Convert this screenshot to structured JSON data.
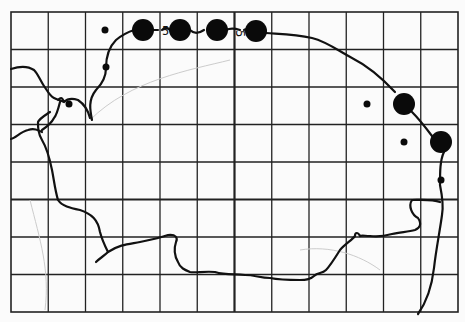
{
  "map": {
    "type": "distribution-grid-map",
    "grid": {
      "left": 11,
      "top": 12,
      "right": 458,
      "bottom": 312,
      "cols": 12,
      "rows": 8,
      "major_col": 6,
      "major_row": 5
    },
    "colors": {
      "background": "#fbfbfb",
      "grid": "#222222",
      "coast": "#111111",
      "dot": "#0a0a0a"
    },
    "labels": [
      {
        "text": "5",
        "x": 162,
        "y": 35
      },
      {
        "text": "5",
        "x": 236,
        "y": 30,
        "rotated": true
      }
    ],
    "records": [
      {
        "size": "large",
        "x": 143,
        "y": 30,
        "r": 11
      },
      {
        "size": "large",
        "x": 180,
        "y": 30,
        "r": 11
      },
      {
        "size": "large",
        "x": 217,
        "y": 30,
        "r": 11
      },
      {
        "size": "large",
        "x": 256,
        "y": 31,
        "r": 11
      },
      {
        "size": "large",
        "x": 404,
        "y": 104,
        "r": 11
      },
      {
        "size": "large",
        "x": 441,
        "y": 142,
        "r": 11
      },
      {
        "size": "small",
        "x": 105,
        "y": 30,
        "r": 3.5
      },
      {
        "size": "small",
        "x": 106,
        "y": 67,
        "r": 3.5
      },
      {
        "size": "small",
        "x": 69,
        "y": 104,
        "r": 3.5
      },
      {
        "size": "small",
        "x": 367,
        "y": 104,
        "r": 3.5
      },
      {
        "size": "small",
        "x": 404,
        "y": 142,
        "r": 3.5
      },
      {
        "size": "small",
        "x": 441,
        "y": 180,
        "r": 3.5
      }
    ]
  }
}
